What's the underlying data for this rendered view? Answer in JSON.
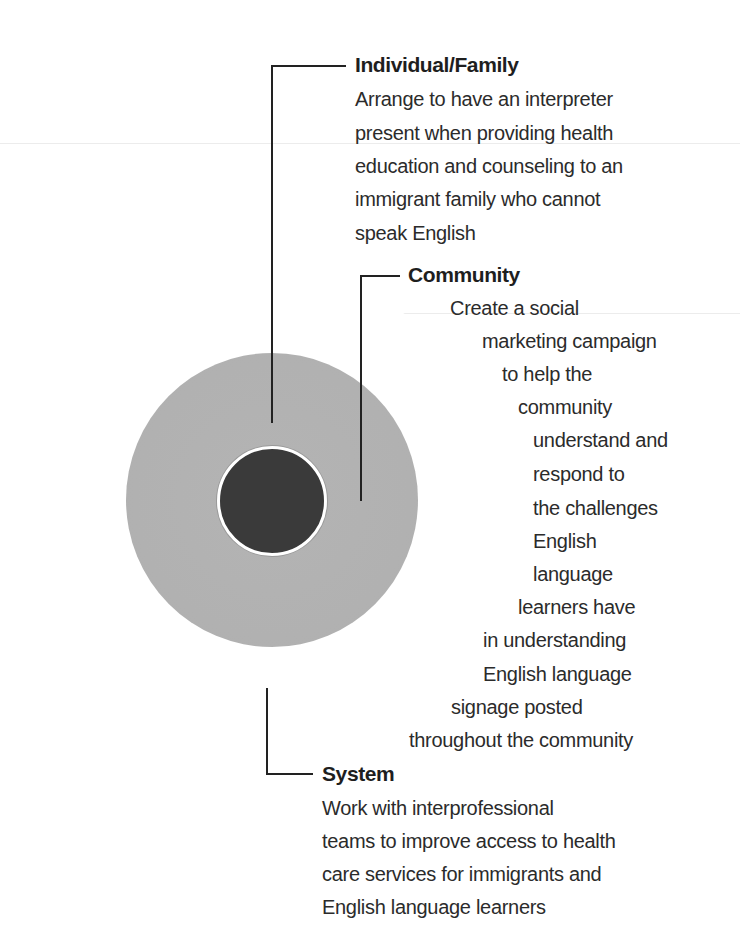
{
  "diagram": {
    "type": "concentric-levels",
    "colors": {
      "core": "#3a3a3a",
      "middle_ring": "#b0b0b0",
      "outer_ring_edge": "#2e2e2e",
      "leader_lines": "#222222",
      "text": "#2b2b2b"
    },
    "levels": [
      {
        "id": "individual",
        "title": "Individual/Family",
        "lines": [
          "Arrange to have an interpreter",
          "present when providing health",
          "education and counseling to an",
          "immigrant family who cannot",
          "speak English"
        ]
      },
      {
        "id": "community",
        "title": "Community",
        "lines": [
          "Create a social",
          "marketing campaign",
          "to help the",
          "community",
          "understand and",
          "respond to",
          "the challenges",
          "English",
          "language",
          "learners have",
          "in understanding",
          "English language",
          "signage posted",
          "throughout the community"
        ]
      },
      {
        "id": "system",
        "title": "System",
        "lines": [
          "Work with interprofessional",
          "teams to improve access to health",
          "care services for immigrants and",
          "English language learners"
        ]
      }
    ]
  }
}
